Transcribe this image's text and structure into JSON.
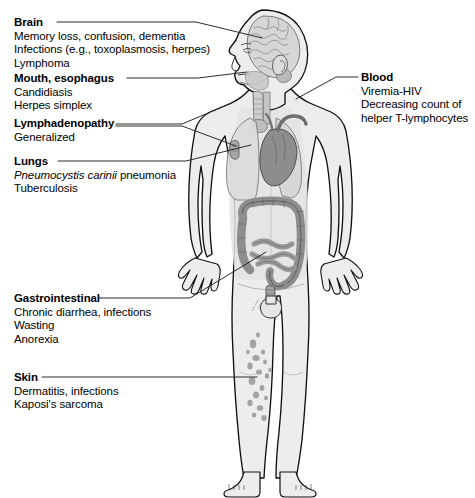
{
  "diagram": {
    "figure_name": "human-body-anatomy-figure",
    "colors": {
      "background": "#ffffff",
      "text": "#000000",
      "leader_line": "#2b2b2b",
      "body_fill": "#ededed",
      "body_outline": "#1a1a1a",
      "organ_mid_gray": "#8d8d8d",
      "organ_light_gray": "#cfcfcf",
      "brain_fill": "#d8d8d8",
      "lesion_gray": "#9a9a9a"
    }
  },
  "callouts": [
    {
      "id": "brain",
      "title": "Brain",
      "lines": [
        "Memory loss, confusion, dementia",
        "Infections (e.g., toxoplasmosis, herpes)",
        "Lymphoma"
      ],
      "side": "left",
      "target": "brain"
    },
    {
      "id": "mouth",
      "title": "Mouth, esophagus",
      "lines": [
        "Candidiasis",
        "Herpes simplex"
      ],
      "side": "left",
      "target": "mouth"
    },
    {
      "id": "lymph",
      "title": "Lymphadenopathy",
      "lines": [
        "Generalized"
      ],
      "side": "left",
      "target": "axillary-lymph-nodes"
    },
    {
      "id": "lungs",
      "title": "Lungs",
      "lines_rich": [
        {
          "italic": "Pneumocystis carinii",
          "roman": " pneumonia"
        },
        {
          "italic": "",
          "roman": "Tuberculosis"
        }
      ],
      "side": "left",
      "target": "lung"
    },
    {
      "id": "gastrointestinal",
      "title": "Gastrointestinal",
      "lines": [
        "Chronic diarrhea, infections",
        "Wasting",
        "Anorexia"
      ],
      "side": "left",
      "target": "rectum-colon"
    },
    {
      "id": "skin",
      "title": "Skin",
      "lines": [
        "Dermatitis, infections",
        "Kaposi's sarcoma"
      ],
      "side": "left",
      "target": "leg-skin-lesions"
    },
    {
      "id": "blood",
      "title": "Blood",
      "lines": [
        "Viremia-HIV",
        "Decreasing count of",
        "helper T-lymphocytes"
      ],
      "side": "right",
      "target": "heart-great-vessels"
    }
  ],
  "anatomy_parts": [
    "head-profile",
    "brain",
    "ear",
    "nose",
    "mouth",
    "trachea",
    "esophagus",
    "lung-right",
    "lung-left",
    "heart",
    "aorta",
    "colon",
    "small-intestine",
    "rectum",
    "genitals",
    "arm-left",
    "arm-right",
    "hand-left",
    "hand-right",
    "leg-left",
    "leg-right",
    "foot-left",
    "foot-right",
    "skin-lesions",
    "axillary-node"
  ]
}
